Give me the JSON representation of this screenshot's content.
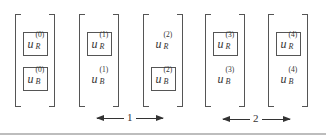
{
  "diagram": {
    "columns": [
      {
        "index": 0,
        "top": {
          "base": "u",
          "sub": "R",
          "sup": "(0)",
          "boxed": true
        },
        "bottom": {
          "base": "u",
          "sub": "B",
          "sup": "(0)",
          "boxed": true
        }
      },
      {
        "index": 1,
        "top": {
          "base": "u",
          "sub": "R",
          "sup": "(1)",
          "boxed": true
        },
        "bottom": {
          "base": "u",
          "sub": "B",
          "sup": "(1)",
          "boxed": false
        }
      },
      {
        "index": 2,
        "top": {
          "base": "u",
          "sub": "R",
          "sup": "(2)",
          "boxed": false
        },
        "bottom": {
          "base": "u",
          "sub": "B",
          "sup": "(2)",
          "boxed": true
        }
      },
      {
        "index": 3,
        "top": {
          "base": "u",
          "sub": "R",
          "sup": "(3)",
          "boxed": true
        },
        "bottom": {
          "base": "u",
          "sub": "B",
          "sup": "(3)",
          "boxed": false
        }
      },
      {
        "index": 4,
        "top": {
          "base": "u",
          "sub": "R",
          "sup": "(4)",
          "boxed": true
        },
        "bottom": {
          "base": "u",
          "sub": "B",
          "sup": "(4)",
          "boxed": false
        }
      }
    ],
    "arrows": [
      {
        "label": "1",
        "spans_columns": [
          1,
          2
        ]
      },
      {
        "label": "2",
        "spans_columns": [
          3,
          4
        ]
      }
    ],
    "colors": {
      "stroke": "#555555",
      "text": "#333333",
      "separator": "#bdbdbd"
    }
  }
}
